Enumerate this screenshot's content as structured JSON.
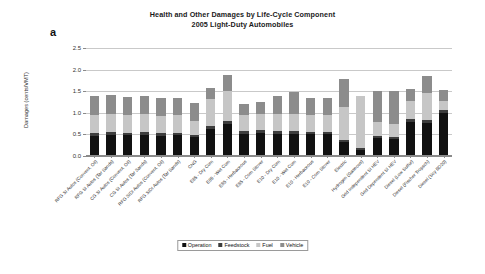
{
  "figure": {
    "panel_letter": "a",
    "title_line1": "Health and Other Damages by Life-Cycle Component",
    "title_line2": "2005 Light-Duty Automobiles"
  },
  "legend": {
    "position": "bottom-center",
    "items": [
      {
        "label": "Operation",
        "color": "#111111"
      },
      {
        "label": "Feedstock",
        "color": "#3d3d3d"
      },
      {
        "label": "Fuel",
        "color": "#c6c6c6"
      },
      {
        "label": "Vehicle",
        "color": "#8c8c8c"
      }
    ]
  },
  "chart_data": {
    "type": "bar",
    "stacked": true,
    "xlabel": "",
    "ylabel": "Damages (cents/VMT)",
    "ylim": [
      0.0,
      2.5
    ],
    "yticks": [
      "0.0",
      "0.5",
      "1.0",
      "1.5",
      "2.0",
      "2.5"
    ],
    "ytick_values": [
      0.0,
      0.5,
      1.0,
      1.5,
      2.0,
      2.5
    ],
    "grid": "horizontal",
    "legend_position": "bottom-center",
    "categories": [
      "RFG SI Autos (Convent. Oil)",
      "RFG SI Autos (Tar Sands)",
      "CG SI Autos (Convent. Oil)",
      "CG SI Autos (Tar Sands)",
      "RFG SIDI Autos (Convent. Oil)",
      "RFG SIDI Autos (Tar Sands)",
      "CNG",
      "E85 - Dry Corn",
      "E85 - Wet Corn",
      "E85 - Herbaceous",
      "E85 - Corn Stover",
      "E10 - Dry Corn",
      "E10 - Wet Corn",
      "E10 - Herbaceous",
      "E10 - Corn Stover",
      "Electric",
      "Hydrogen (Gaseous)",
      "Grid Independent SI HEV",
      "Grid Dependent SI HEV",
      "Diesel (Low Sulfur)",
      "Diesel (Fischer Tropsch)",
      "Diesel (Soy BD20)"
    ],
    "series": [
      {
        "name": "Operation",
        "color": "#111111",
        "values": [
          0.45,
          0.46,
          0.46,
          0.47,
          0.45,
          0.46,
          0.41,
          0.61,
          0.71,
          0.49,
          0.51,
          0.49,
          0.49,
          0.48,
          0.48,
          0.31,
          0.12,
          0.39,
          0.37,
          0.77,
          0.73,
          0.97
        ]
      },
      {
        "name": "Feedstock",
        "color": "#3d3d3d",
        "values": [
          0.06,
          0.07,
          0.06,
          0.06,
          0.06,
          0.06,
          0.05,
          0.07,
          0.08,
          0.06,
          0.06,
          0.06,
          0.06,
          0.06,
          0.06,
          0.04,
          0.04,
          0.05,
          0.05,
          0.07,
          0.07,
          0.08
        ]
      },
      {
        "name": "Fuel",
        "color": "#c6c6c6",
        "values": [
          0.41,
          0.42,
          0.4,
          0.41,
          0.39,
          0.4,
          0.32,
          0.61,
          0.69,
          0.38,
          0.39,
          0.4,
          0.4,
          0.39,
          0.39,
          0.76,
          1.21,
          0.32,
          0.3,
          0.4,
          0.63,
          0.2
        ]
      },
      {
        "name": "Vehicle",
        "color": "#8c8c8c",
        "values": [
          0.45,
          0.44,
          0.43,
          0.42,
          0.41,
          0.4,
          0.42,
          0.26,
          0.38,
          0.26,
          0.27,
          0.42,
          0.5,
          0.38,
          0.38,
          0.64,
          0.0,
          0.72,
          0.76,
          0.28,
          0.41,
          0.26
        ]
      }
    ],
    "totals": [
      1.37,
      1.39,
      1.35,
      1.36,
      1.31,
      1.32,
      1.2,
      1.55,
      1.86,
      1.19,
      1.23,
      1.37,
      1.45,
      1.31,
      1.31,
      1.75,
      1.37,
      1.48,
      1.48,
      1.52,
      1.84,
      1.51
    ]
  }
}
